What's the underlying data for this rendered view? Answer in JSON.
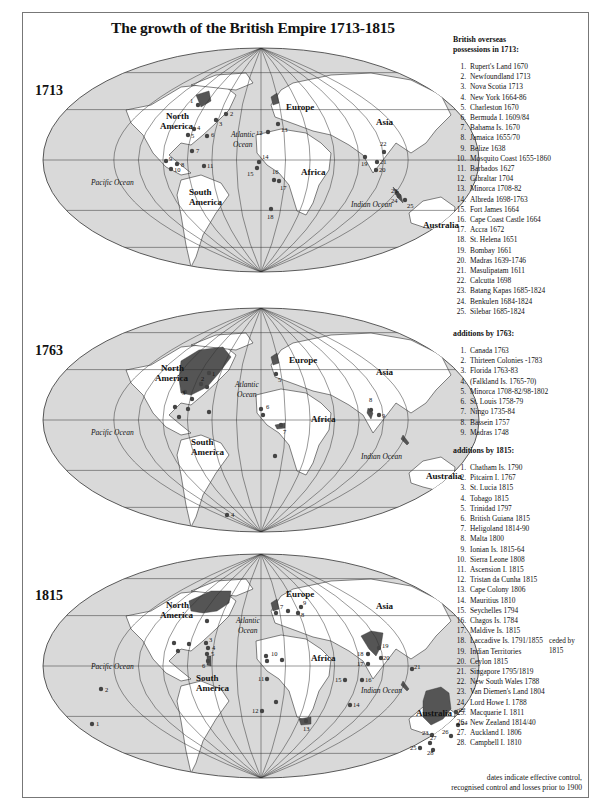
{
  "title": "The growth of the British Empire 1713-1815",
  "colors": {
    "ocean": "#d9d9d9",
    "land": "#ffffff",
    "british_territory": "#555555",
    "point": "#444444",
    "graticule": "#333333",
    "frame": "#777777"
  },
  "maps": [
    {
      "year": "1713",
      "labels": {
        "north_america": [
          "North",
          "America"
        ],
        "south_america": [
          "South",
          "America"
        ],
        "europe": "Europe",
        "asia": "Asia",
        "africa": "Africa",
        "australia": "Australia",
        "atlantic": [
          "Atlantic",
          "Ocean"
        ],
        "pacific": "Pacific Ocean",
        "indian": "Indian Ocean"
      },
      "points": [
        {
          "n": "1",
          "x": 167,
          "y": 70,
          "lx": -8,
          "ly": -2
        },
        {
          "n": "2",
          "x": 195,
          "y": 79,
          "lx": 4,
          "ly": 2
        },
        {
          "n": "3",
          "x": 185,
          "y": 85,
          "lx": 3,
          "ly": 6
        },
        {
          "n": "4",
          "x": 163,
          "y": 94,
          "lx": 3,
          "ly": 1
        },
        {
          "n": "5",
          "x": 157,
          "y": 100,
          "lx": 3,
          "ly": 3
        },
        {
          "n": "6",
          "x": 176,
          "y": 101,
          "lx": 4,
          "ly": 1
        },
        {
          "n": "7",
          "x": 161,
          "y": 116,
          "lx": 4,
          "ly": 2
        },
        {
          "n": "8",
          "x": 146,
          "y": 129,
          "lx": 4,
          "ly": 3
        },
        {
          "n": "9",
          "x": 135,
          "y": 126,
          "lx": 3,
          "ly": 0
        },
        {
          "n": "10",
          "x": 140,
          "y": 134,
          "lx": 3,
          "ly": 3
        },
        {
          "n": "11",
          "x": 173,
          "y": 131,
          "lx": 3,
          "ly": 2
        },
        {
          "n": "12",
          "x": 237,
          "y": 97,
          "lx": -12,
          "ly": 3
        },
        {
          "n": "13",
          "x": 247,
          "y": 89,
          "lx": 3,
          "ly": 8
        },
        {
          "n": "14",
          "x": 228,
          "y": 127,
          "lx": 3,
          "ly": -3
        },
        {
          "n": "15",
          "x": 226,
          "y": 133,
          "lx": -10,
          "ly": 8
        },
        {
          "n": "16",
          "x": 243,
          "y": 145,
          "lx": -2,
          "ly": -6
        },
        {
          "n": "17",
          "x": 248,
          "y": 146,
          "lx": 1,
          "ly": 9
        },
        {
          "n": "18",
          "x": 240,
          "y": 174,
          "lx": -4,
          "ly": 10
        },
        {
          "n": "19",
          "x": 334,
          "y": 122,
          "lx": -4,
          "ly": 9
        },
        {
          "n": "20",
          "x": 345,
          "y": 135,
          "lx": 3,
          "ly": 2
        },
        {
          "n": "21",
          "x": 346,
          "y": 127,
          "lx": 3,
          "ly": 2
        },
        {
          "n": "22",
          "x": 353,
          "y": 117,
          "lx": -4,
          "ly": -6
        },
        {
          "n": "23",
          "x": 366,
          "y": 158,
          "lx": -6,
          "ly": 0
        },
        {
          "n": "24",
          "x": 368,
          "y": 161,
          "lx": -8,
          "ly": 7
        },
        {
          "n": "25",
          "x": 374,
          "y": 165,
          "lx": 2,
          "ly": 8
        }
      ]
    },
    {
      "year": "1763",
      "labels": {
        "north_america": [
          "North",
          "America"
        ],
        "south_america": [
          "South",
          "America"
        ],
        "europe": "Europe",
        "asia": "Asia",
        "africa": "Africa",
        "australia": "Australia",
        "atlantic": [
          "Atlantic",
          "Ocean"
        ],
        "pacific": "Pacific Ocean",
        "indian": "Indian Ocean"
      },
      "points": [
        {
          "n": "1",
          "x": 178,
          "y": 78,
          "lx": 3,
          "ly": 3
        },
        {
          "n": "2",
          "x": 170,
          "y": 89,
          "lx": 0,
          "ly": -3
        },
        {
          "n": "3",
          "x": 154,
          "y": 97,
          "lx": -3,
          "ly": 3
        },
        {
          "n": "4",
          "x": 196,
          "y": 220,
          "lx": 4,
          "ly": 2
        },
        {
          "n": "5",
          "x": 245,
          "y": 79,
          "lx": 2,
          "ly": 8
        },
        {
          "n": "6",
          "x": 230,
          "y": 114,
          "lx": 5,
          "ly": 0
        },
        {
          "n": "7",
          "x": 250,
          "y": 130,
          "lx": 2,
          "ly": 9
        },
        {
          "n": "8",
          "x": 340,
          "y": 115,
          "lx": -2,
          "ly": -8
        },
        {
          "n": "9",
          "x": 348,
          "y": 120,
          "lx": 3,
          "ly": 3
        }
      ],
      "extra_points": [
        {
          "x": 176,
          "y": 92
        },
        {
          "x": 161,
          "y": 104
        },
        {
          "x": 144,
          "y": 112
        },
        {
          "x": 157,
          "y": 114
        },
        {
          "x": 148,
          "y": 122
        },
        {
          "x": 178,
          "y": 117
        },
        {
          "x": 244,
          "y": 161
        },
        {
          "x": 232,
          "y": 120
        }
      ]
    },
    {
      "year": "1815",
      "labels": {
        "north_america": [
          "North",
          "America"
        ],
        "south_america": [
          "South",
          "America"
        ],
        "europe": "Europe",
        "asia": "Asia",
        "africa": "Africa",
        "australia": "Australia",
        "atlantic": [
          "Atlantic",
          "Ocean"
        ],
        "pacific": "Pacific Ocean",
        "indian": "Indian Ocean"
      },
      "points": [
        {
          "n": "1",
          "x": 61,
          "y": 183,
          "lx": 4,
          "ly": 2
        },
        {
          "n": "2",
          "x": 70,
          "y": 148,
          "lx": 4,
          "ly": 3
        },
        {
          "n": "3",
          "x": 175,
          "y": 102,
          "lx": 3,
          "ly": -1
        },
        {
          "n": "4",
          "x": 177,
          "y": 107,
          "lx": 4,
          "ly": 2
        },
        {
          "n": "5",
          "x": 176,
          "y": 113,
          "lx": 4,
          "ly": 2
        },
        {
          "n": "6",
          "x": 177,
          "y": 120,
          "lx": -6,
          "ly": 7
        },
        {
          "n": "7",
          "x": 257,
          "y": 70,
          "lx": -8,
          "ly": -2
        },
        {
          "n": "8",
          "x": 267,
          "y": 72,
          "lx": 3,
          "ly": 4
        },
        {
          "n": "9",
          "x": 270,
          "y": 66,
          "lx": 2,
          "ly": -2
        },
        {
          "n": "10",
          "x": 235,
          "y": 115,
          "lx": 5,
          "ly": 0
        },
        {
          "n": "11",
          "x": 236,
          "y": 138,
          "lx": -9,
          "ly": 2
        },
        {
          "n": "12",
          "x": 231,
          "y": 170,
          "lx": -10,
          "ly": 2
        },
        {
          "n": "13",
          "x": 275,
          "y": 180,
          "lx": -3,
          "ly": 10
        },
        {
          "n": "14",
          "x": 319,
          "y": 164,
          "lx": 3,
          "ly": 2
        },
        {
          "n": "15",
          "x": 314,
          "y": 139,
          "lx": -10,
          "ly": 2
        },
        {
          "n": "16",
          "x": 331,
          "y": 139,
          "lx": 3,
          "ly": 2
        },
        {
          "n": "17",
          "x": 337,
          "y": 123,
          "lx": -11,
          "ly": 2
        },
        {
          "n": "18",
          "x": 337,
          "y": 113,
          "lx": -11,
          "ly": 2
        },
        {
          "n": "19",
          "x": 348,
          "y": 107,
          "lx": 3,
          "ly": 0
        },
        {
          "n": "20",
          "x": 350,
          "y": 117,
          "lx": 2,
          "ly": 2
        },
        {
          "n": "21",
          "x": 381,
          "y": 128,
          "lx": 2,
          "ly": 0
        },
        {
          "n": "22",
          "x": 425,
          "y": 171,
          "lx": 3,
          "ly": 0
        },
        {
          "n": "23",
          "x": 401,
          "y": 194,
          "lx": -10,
          "ly": 0
        },
        {
          "n": "24",
          "x": 427,
          "y": 184,
          "lx": 3,
          "ly": 0
        },
        {
          "n": "25",
          "x": 389,
          "y": 207,
          "lx": -10,
          "ly": 2
        },
        {
          "n": "26",
          "x": 420,
          "y": 195,
          "lx": -9,
          "ly": -2
        },
        {
          "n": "27",
          "x": 399,
          "y": 202,
          "lx": 0,
          "ly": -3
        },
        {
          "n": "28",
          "x": 402,
          "y": 209,
          "lx": -6,
          "ly": 5
        }
      ],
      "extra_points": [
        {
          "x": 143,
          "y": 102
        },
        {
          "x": 158,
          "y": 103
        },
        {
          "x": 147,
          "y": 110
        },
        {
          "x": 176,
          "y": 80
        },
        {
          "x": 245,
          "y": 72
        },
        {
          "x": 245,
          "y": 161
        },
        {
          "x": 251,
          "y": 119
        },
        {
          "x": 236,
          "y": 120
        }
      ]
    }
  ],
  "legend": {
    "sections": [
      {
        "heading": [
          "British overseas",
          "possessions in 1713:"
        ],
        "items": [
          {
            "n": "1.",
            "text": "Rupert's Land 1670"
          },
          {
            "n": "2.",
            "text": "Newfoundland 1713"
          },
          {
            "n": "3.",
            "text": "Nova Scotia 1713"
          },
          {
            "n": "4.",
            "text": "New York 1664-86"
          },
          {
            "n": "5.",
            "text": "Charleston 1670"
          },
          {
            "n": "6.",
            "text": "Bermuda I. 1609/84"
          },
          {
            "n": "7.",
            "text": "Bahama Is. 1670"
          },
          {
            "n": "8.",
            "text": "Jamaica 1655/70"
          },
          {
            "n": "9.",
            "text": "Belize 1638"
          },
          {
            "n": "10.",
            "text": "Mosquito Coast 1655-1860"
          },
          {
            "n": "11.",
            "text": "Barbados 1627"
          },
          {
            "n": "12.",
            "text": "Gibraltar 1704"
          },
          {
            "n": "13.",
            "text": "Minorca 1708-82"
          },
          {
            "n": "14.",
            "text": "Albreda 1698-1763"
          },
          {
            "n": "15.",
            "text": "Fort James 1664"
          },
          {
            "n": "16.",
            "text": "Cape Coast Castle 1664"
          },
          {
            "n": "17.",
            "text": "Accra 1672"
          },
          {
            "n": "18.",
            "text": "St. Helena 1651"
          },
          {
            "n": "19.",
            "text": "Bombay 1661"
          },
          {
            "n": "20.",
            "text": "Madras 1639-1746"
          },
          {
            "n": "21.",
            "text": "Masulipatam 1611"
          },
          {
            "n": "22.",
            "text": "Calcutta 1698"
          },
          {
            "n": "23.",
            "text": "Batang Kapas 1685-1824"
          },
          {
            "n": "24.",
            "text": "Benkulen 1684-1824"
          },
          {
            "n": "25.",
            "text": "Silebar 1685-1824"
          }
        ]
      },
      {
        "heading": [
          "additions by 1763:"
        ],
        "items": [
          {
            "n": "1.",
            "text": "Canada 1763"
          },
          {
            "n": "2.",
            "text": "Thirteen Colonies -1783"
          },
          {
            "n": "3.",
            "text": "Florida 1763-83"
          },
          {
            "n": "4.",
            "text": "(Falkland Is. 1765-70)"
          },
          {
            "n": "5.",
            "text": "Minorca 1708-82/98-1802"
          },
          {
            "n": "6.",
            "text": "St. Louis 1758-79"
          },
          {
            "n": "7.",
            "text": "Ningo 1735-84"
          },
          {
            "n": "8.",
            "text": "Bassein 1757"
          },
          {
            "n": "9.",
            "text": "Madras 1748"
          }
        ]
      },
      {
        "heading": [
          "additions by 1815:"
        ],
        "items": [
          {
            "n": "1.",
            "text": "Chatham Is. 1790"
          },
          {
            "n": "2.",
            "text": "Pitcairn I. 1767"
          },
          {
            "n": "3.",
            "text": "St. Lucia 1815"
          },
          {
            "n": "4.",
            "text": "Tobago 1815"
          },
          {
            "n": "5.",
            "text": "Trinidad 1797"
          },
          {
            "n": "6.",
            "text": "British Guiana 1815"
          },
          {
            "n": "7.",
            "text": "Heligoland 1814-90"
          },
          {
            "n": "8.",
            "text": "Malta 1800"
          },
          {
            "n": "9.",
            "text": "Ionian Is. 1815-64"
          },
          {
            "n": "10.",
            "text": "Sierra Leone 1808"
          },
          {
            "n": "11.",
            "text": "Ascension I. 1815"
          },
          {
            "n": "12.",
            "text": "Tristan da Cunha 1815"
          },
          {
            "n": "13.",
            "text": "Cape Colony 1806"
          },
          {
            "n": "14.",
            "text": "Mauritius 1810"
          },
          {
            "n": "15.",
            "text": "Seychelles 1794"
          },
          {
            "n": "16.",
            "text": "Chagos Is. 1784"
          },
          {
            "n": "17.",
            "text": "Maldive Is. 1815"
          },
          {
            "n": "18.",
            "text": "Laccadive Is. 1791/1855"
          },
          {
            "n": "19.",
            "text": "Indian Territories"
          },
          {
            "n": "20.",
            "text": "Ceylon 1815"
          },
          {
            "n": "21.",
            "text": "Singapore 1795/1819"
          },
          {
            "n": "22.",
            "text": "New South Wales 1788"
          },
          {
            "n": "23.",
            "text": "Van Diemen's Land 1804"
          },
          {
            "n": "24.",
            "text": "Lord Howe I. 1788"
          },
          {
            "n": "25.",
            "text": "Macquarie I. 1811"
          },
          {
            "n": "26.",
            "text": "New Zealand 1814/40"
          },
          {
            "n": "27.",
            "text": "Auckland I. 1806"
          },
          {
            "n": "28.",
            "text": "Campbell I. 1810"
          }
        ],
        "ceded_note": "ceded by 1815"
      }
    ],
    "footnote": [
      "dates indicate effective control,",
      "recognised control and losses prior to 1900"
    ]
  }
}
